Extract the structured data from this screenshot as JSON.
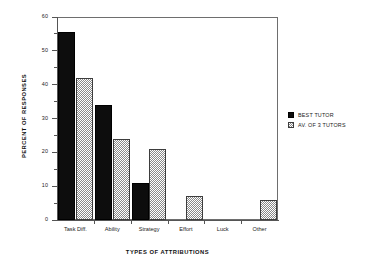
{
  "chart_data": {
    "type": "bar",
    "title": "",
    "xlabel": "TYPES OF ATTRIBUTIONS",
    "ylabel": "PERCENT OF RESPONSES",
    "categories": [
      "Task Diff.",
      "Ability",
      "Strategy",
      "Effort",
      "Luck",
      "Other"
    ],
    "series": [
      {
        "name": "BEST TUTOR",
        "values": [
          55.5,
          34,
          11,
          0,
          0,
          0
        ],
        "style": "solid-black"
      },
      {
        "name": "AV. OF 3 TUTORS",
        "values": [
          42,
          24,
          21,
          7,
          0,
          6
        ],
        "style": "hatched-gray"
      }
    ],
    "ylim": [
      0,
      60
    ],
    "ytick_major": [
      0,
      10,
      20,
      30,
      40,
      50,
      60
    ],
    "ytick_minor": [
      5,
      15,
      25,
      35,
      45,
      55
    ],
    "ytick_labels": [
      "0",
      "10",
      "20",
      "30",
      "40",
      "50",
      "60"
    ],
    "grid": false,
    "legend_position": "right"
  },
  "legend": {
    "entries": [
      {
        "label": "BEST TUTOR"
      },
      {
        "label": "AV. OF 3 TUTORS"
      }
    ]
  },
  "colors": {
    "series_best_tutor": "#0d0d0d",
    "series_av_3_tutors": "#8a8a8a",
    "axis": "#555555",
    "frame": "#6e6e6e",
    "background": "#ffffff",
    "text": "#1a1a1a"
  }
}
